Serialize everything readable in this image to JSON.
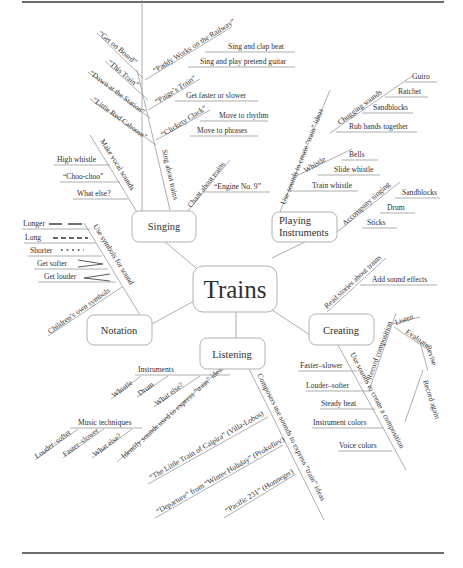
{
  "diagram": {
    "title": "Trains",
    "type": "mind map",
    "nodes": {
      "center": "Trains",
      "singing": "Singing",
      "playing": [
        "Playing",
        "Instruments"
      ],
      "notation": "Notation",
      "listening": "Listening",
      "creating": "Creating"
    },
    "singing": {
      "sing_about_trains": "Sing about trains",
      "songs": [
        "“Get on Board”",
        "“This Train”",
        "“Down at the Station”",
        "“Little Red Caboose”"
      ],
      "paddy": "“Paddy Works on the Railway”",
      "paddy_items": [
        "Sing and clap beat",
        "Sing and play pretend guitar"
      ],
      "paige": "“Paige’s Train”",
      "paige_items": [
        "Get faster or slower"
      ],
      "clickety": "“Clickety Clack”",
      "clickety_items": [
        "Move to rhythm",
        "Move to phrases"
      ],
      "vocal": "Make vocal sounds",
      "vocal_items": [
        "High whistle",
        "“Choo-choo”",
        "What else?"
      ],
      "chant": "Chant about trains",
      "chant_items": [
        "“Engine No. 9”"
      ]
    },
    "playing": {
      "use_sounds": "Use sounds to create “train” ideas",
      "chugging": "Chugging sounds",
      "chugging_items": [
        "Guiro",
        "Ratchet",
        "Sandblocks",
        "Rub hands together"
      ],
      "whistle": "Whistle",
      "whistle_items": [
        "Bells",
        "Slide whistle"
      ],
      "train_whistle": "Train whistle",
      "accompany": "Accompany singing",
      "accompany_items": [
        "Sandblocks",
        "Drum",
        "Sticks"
      ]
    },
    "notation": {
      "use_symbols": "Use symbols for sound",
      "symbols": [
        "Longer",
        "Long",
        "Shorter",
        "Get softer",
        "Get louder"
      ],
      "childrens": "Children’s own symbols"
    },
    "creating": {
      "read_stories": "Read stories about trains",
      "add_effects": "Add sound effects",
      "use_sounds": "Use sounds to create a composition",
      "use_sounds_items": [
        "Faster–slower",
        "Louder–softer",
        "Steady beat",
        "Instrument colors",
        "Voice colors"
      ],
      "record": "Record composition",
      "record_items": [
        "Listen",
        "Evaluate",
        "Revise",
        "Record again"
      ]
    },
    "listening": {
      "identify": "Identify sounds used to express “train” ideas",
      "instruments": "Instruments",
      "instruments_items": [
        "Whistle",
        "Drum",
        "What else?"
      ],
      "techniques": "Music techniques",
      "techniques_items": [
        "Louder–softer",
        "Faster–slower",
        "What else?"
      ],
      "composers": "Composers use sounds to express “train” ideas",
      "works": [
        "“The Little Train of Caipira” (Villa-Lobos)",
        "“Departure” from “Winter Holiday” (Prokofiev)",
        "“Pacific 231” (Honneger)"
      ]
    }
  }
}
